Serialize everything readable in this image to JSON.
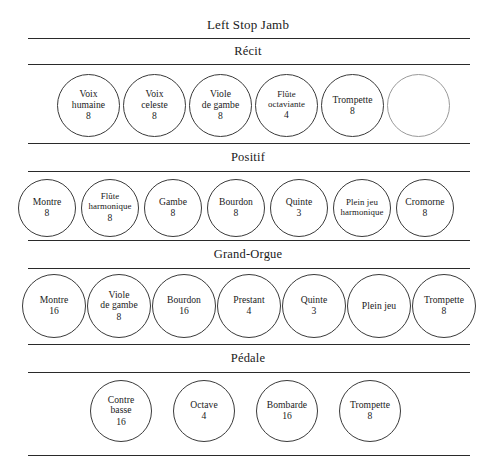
{
  "title": "Left Stop Jamb",
  "divisions": [
    {
      "id": "recit",
      "name": "Récit",
      "stops": [
        {
          "name_line1": "Voix",
          "name_line2": "humaine",
          "pitch": "8"
        },
        {
          "name_line1": "Voix",
          "name_line2": "celeste",
          "pitch": "8"
        },
        {
          "name_line1": "Viole",
          "name_line2": "de gambe",
          "pitch": "8"
        },
        {
          "name_line1": "Flûte",
          "name_line2": "octaviante",
          "pitch": "4"
        },
        {
          "name_line1": "Trompette",
          "name_line2": "",
          "pitch": "8"
        },
        {
          "name_line1": "",
          "name_line2": "",
          "pitch": ""
        }
      ]
    },
    {
      "id": "positif",
      "name": "Positif",
      "stops": [
        {
          "name_line1": "Montre",
          "name_line2": "",
          "pitch": "8"
        },
        {
          "name_line1": "Flûte",
          "name_line2": "harmonique",
          "pitch": "8"
        },
        {
          "name_line1": "Gambe",
          "name_line2": "",
          "pitch": "8"
        },
        {
          "name_line1": "Bourdon",
          "name_line2": "",
          "pitch": "8"
        },
        {
          "name_line1": "Quinte",
          "name_line2": "",
          "pitch": "3"
        },
        {
          "name_line1": "Plein jeu",
          "name_line2": "harmonique",
          "pitch": ""
        },
        {
          "name_line1": "Cromorne",
          "name_line2": "",
          "pitch": "8"
        }
      ]
    },
    {
      "id": "grand-orgue",
      "name": "Grand-Orgue",
      "stops": [
        {
          "name_line1": "Montre",
          "name_line2": "",
          "pitch": "16"
        },
        {
          "name_line1": "Viole",
          "name_line2": "de gambe",
          "pitch": "8"
        },
        {
          "name_line1": "Bourdon",
          "name_line2": "",
          "pitch": "16"
        },
        {
          "name_line1": "Prestant",
          "name_line2": "",
          "pitch": "4"
        },
        {
          "name_line1": "Quinte",
          "name_line2": "",
          "pitch": "3"
        },
        {
          "name_line1": "Plein jeu",
          "name_line2": "",
          "pitch": ""
        },
        {
          "name_line1": "Trompette",
          "name_line2": "",
          "pitch": "8"
        }
      ]
    },
    {
      "id": "pedale",
      "name": "Pédale",
      "stops": [
        {
          "name_line1": "Contre",
          "name_line2": "basse",
          "pitch": "16"
        },
        {
          "name_line1": "Octave",
          "name_line2": "",
          "pitch": "4"
        },
        {
          "name_line1": "Bombarde",
          "name_line2": "",
          "pitch": "16"
        },
        {
          "name_line1": "Trompette",
          "name_line2": "",
          "pitch": "8"
        }
      ]
    }
  ]
}
